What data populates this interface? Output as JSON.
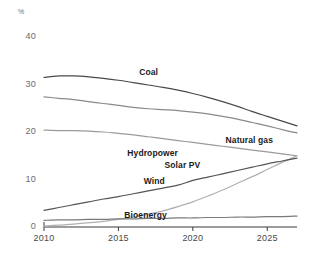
{
  "chart_data": {
    "type": "line",
    "title": "",
    "subtitle": "",
    "xlabel": "",
    "ylabel": "%",
    "unit_label": "%",
    "xlim": [
      2010,
      2027
    ],
    "ylim": [
      0,
      42
    ],
    "yticks": [
      0,
      10,
      20,
      30,
      40
    ],
    "xticks": [
      2010,
      2015,
      2020,
      2025
    ],
    "ytick_labels": [
      "0",
      "10",
      "20",
      "30",
      "40"
    ],
    "xtick_labels": [
      "2010",
      "2015",
      "2020",
      "2025"
    ],
    "grid": false,
    "legend": "inline-labels",
    "x": [
      2010,
      2011,
      2012,
      2013,
      2014,
      2015,
      2016,
      2017,
      2018,
      2019,
      2020,
      2021,
      2022,
      2023,
      2024,
      2025,
      2026,
      2027
    ],
    "series": [
      {
        "name": "Coal",
        "color": "#4a4a4a",
        "label_x": 2016.4,
        "label_y": 32.6,
        "values": [
          31.5,
          31.8,
          31.8,
          31.6,
          31.3,
          30.9,
          30.4,
          29.9,
          29.4,
          28.8,
          28.1,
          27.3,
          26.4,
          25.4,
          24.3,
          23.3,
          22.3,
          21.3
        ]
      },
      {
        "name": "Natural gas",
        "color": "#8a8a8a",
        "label_x": 2022.2,
        "label_y": 18.3,
        "values": [
          27.4,
          27.1,
          26.8,
          26.4,
          26.0,
          25.6,
          25.2,
          24.9,
          24.7,
          24.5,
          24.2,
          23.8,
          23.3,
          22.7,
          22.0,
          21.3,
          20.5,
          19.8
        ]
      },
      {
        "name": "Hydropower",
        "color": "#9a9a9a",
        "label_x": 2015.6,
        "label_y": 15.6,
        "values": [
          20.4,
          20.3,
          20.3,
          20.2,
          20.0,
          19.7,
          19.4,
          19.0,
          18.6,
          18.2,
          17.8,
          17.4,
          17.0,
          16.6,
          16.2,
          15.8,
          15.4,
          15.0
        ]
      },
      {
        "name": "Solar PV",
        "color": "#b0b0b0",
        "label_x": 2018.1,
        "label_y": 13.0,
        "values": [
          0.2,
          0.4,
          0.6,
          0.9,
          1.2,
          1.6,
          2.1,
          2.7,
          3.4,
          4.3,
          5.3,
          6.5,
          7.8,
          9.2,
          10.6,
          12.1,
          13.6,
          15.0
        ]
      },
      {
        "name": "Wind",
        "color": "#555555",
        "label_x": 2016.7,
        "label_y": 9.6,
        "values": [
          3.5,
          4.1,
          4.7,
          5.3,
          5.9,
          6.4,
          7.0,
          7.6,
          8.2,
          8.8,
          9.8,
          10.5,
          11.2,
          11.9,
          12.6,
          13.3,
          13.9,
          14.5
        ]
      },
      {
        "name": "Bioenergy",
        "color": "#7a7a7a",
        "label_x": 2015.4,
        "label_y": 2.5,
        "values": [
          1.4,
          1.5,
          1.5,
          1.6,
          1.6,
          1.7,
          1.7,
          1.8,
          1.8,
          1.9,
          1.9,
          2.0,
          2.0,
          2.1,
          2.1,
          2.2,
          2.2,
          2.3
        ]
      }
    ]
  }
}
